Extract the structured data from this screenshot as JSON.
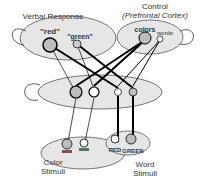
{
  "layers": {
    "verbal_response": {
      "label": "Verbal Response",
      "units": [
        "\"red\"",
        "\"green\""
      ]
    },
    "control": {
      "label": "Control",
      "sublabel": "(Prefrontal Cortex)",
      "units": [
        "colors",
        "words"
      ]
    },
    "color_stimuli": {
      "label_line1": "Color",
      "label_line2": "Stimuli"
    },
    "word_stimuli": {
      "label_line1": "Word",
      "label_line2": "Stimuli",
      "units": [
        "RED",
        "GREEN"
      ]
    }
  },
  "colors": {
    "ellipse": "#e6e6e6",
    "unit_fill": "#bdbdbd",
    "stroke": "#000000",
    "red_bar": "#8c4a4a",
    "green_bar": "#4a7a5a"
  }
}
